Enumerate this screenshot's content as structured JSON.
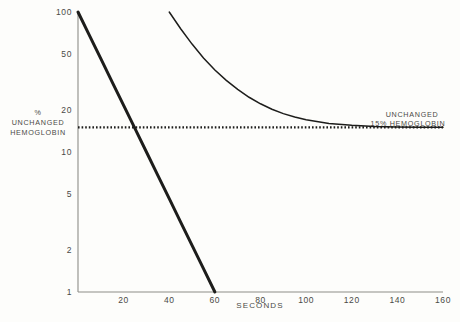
{
  "chart_data": {
    "type": "line",
    "title": "",
    "xlabel": "SECONDS",
    "ylabel": "% UNCHANGED HEMOGLOBIN",
    "yscale": "log",
    "xlim": [
      0,
      160
    ],
    "ylim": [
      1,
      100
    ],
    "grid": false,
    "legend": "none",
    "xticks": [
      20,
      40,
      60,
      80,
      100,
      120,
      140,
      160
    ],
    "xtick_labels": [
      "20",
      "40",
      "60",
      "80",
      "100",
      "120",
      "140",
      "160"
    ],
    "yticks": [
      1,
      2,
      5,
      10,
      20,
      50,
      100
    ],
    "ytick_labels": [
      "1",
      "2",
      "5",
      "10",
      "20",
      "50",
      "100"
    ],
    "series": [
      {
        "name": "first-order decay",
        "style": "solid-thick",
        "x": [
          0,
          5,
          10,
          15,
          20,
          25,
          30,
          35,
          40,
          45,
          50,
          55,
          60
        ],
        "y": [
          100,
          68.1,
          46.4,
          31.6,
          21.5,
          14.7,
          10.0,
          6.81,
          4.64,
          3.16,
          2.15,
          1.47,
          1.0
        ]
      },
      {
        "name": "decay to 15% plateau",
        "style": "solid-thin",
        "x": [
          40,
          45,
          50,
          55,
          60,
          65,
          70,
          75,
          80,
          85,
          90,
          95,
          100,
          110,
          120,
          130,
          140,
          150,
          160
        ],
        "y": [
          100,
          76,
          59,
          47,
          38.5,
          32.5,
          28,
          24.6,
          22.1,
          20.2,
          18.8,
          17.8,
          17.0,
          16.0,
          15.5,
          15.2,
          15.1,
          15.0,
          15.0
        ]
      },
      {
        "name": "unchanged 15% hemoglobin level",
        "style": "dotted",
        "x": [
          0,
          160
        ],
        "y": [
          15,
          15
        ]
      }
    ],
    "annotations": [
      {
        "id": "left-axis-annotation",
        "lines": [
          "%",
          "UNCHANGED",
          "HEMOGLOBIN"
        ]
      },
      {
        "id": "plateau-annotation",
        "lines": [
          "UNCHANGED",
          "15% HEMOGLOBIN"
        ]
      }
    ]
  },
  "axis": {
    "x_title": "SECONDS"
  }
}
